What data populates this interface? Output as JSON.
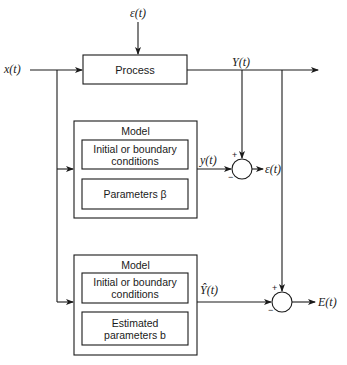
{
  "diagram": {
    "type": "block-diagram",
    "signals": {
      "input": "x(t)",
      "disturbance": "ε(t)",
      "process_output": "Y(t)",
      "model1_output": "y(t)",
      "error1": "ε(t)",
      "model2_output": "Ŷ(t)",
      "error2": "E(t)"
    },
    "process": {
      "label": "Process"
    },
    "model1": {
      "title": "Model",
      "block1": "Initial or boundary conditions",
      "block1_line1": "Initial or boundary",
      "block1_line2": "conditions",
      "block2": "Parameters β"
    },
    "model2": {
      "title": "Model",
      "block1": "Initial or boundary conditions",
      "block1_line1": "Initial or boundary",
      "block1_line2": "conditions",
      "block2": "Estimated parameters b",
      "block2_line1": "Estimated",
      "block2_line2": "parameters b"
    },
    "junction1": {
      "plus": "+",
      "minus": "−"
    },
    "junction2": {
      "plus": "+",
      "minus": "−"
    }
  }
}
